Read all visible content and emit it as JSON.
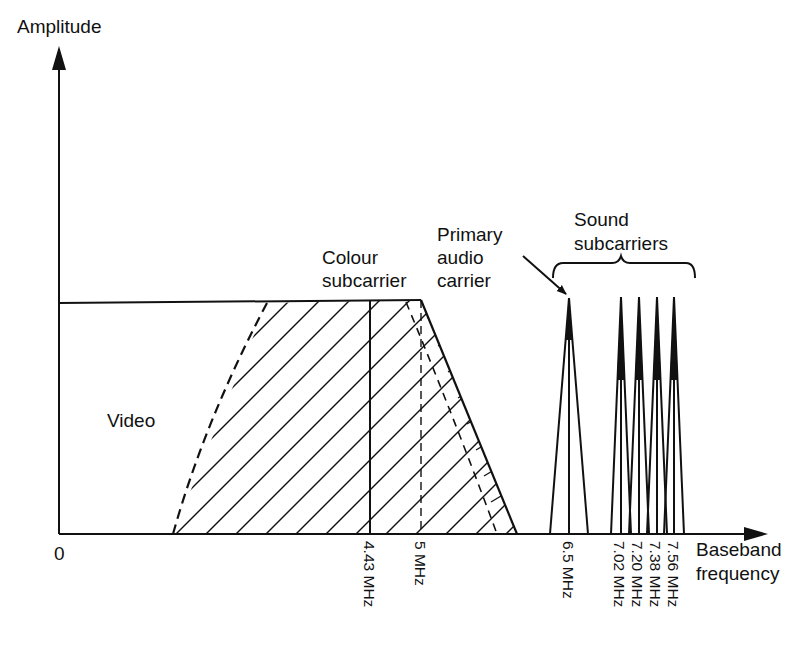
{
  "diagram": {
    "y_axis": {
      "label": "Amplitude"
    },
    "x_axis": {
      "label_line1": "Baseband",
      "label_line2": "frequency",
      "origin": "0"
    },
    "regions": {
      "video": "Video",
      "colour_subcarrier_line1": "Colour",
      "colour_subcarrier_line2": "subcarrier",
      "primary_audio_line1": "Primary",
      "primary_audio_line2": "audio",
      "primary_audio_line3": "carrier",
      "sound_subcarriers_line1": "Sound",
      "sound_subcarriers_line2": "subcarriers"
    },
    "ticks": [
      {
        "id": "t443",
        "label": "4.43 MHz"
      },
      {
        "id": "t5",
        "label": "5 MHz"
      },
      {
        "id": "t65",
        "label": "6.5 MHz"
      },
      {
        "id": "t702",
        "label": "7.02 MHz"
      },
      {
        "id": "t720",
        "label": "7.20 MHz"
      },
      {
        "id": "t738",
        "label": "7.38 MHz"
      },
      {
        "id": "t756",
        "label": "7.56 MHz"
      }
    ],
    "colors": {
      "ink": "#111111",
      "background": "#ffffff"
    }
  }
}
